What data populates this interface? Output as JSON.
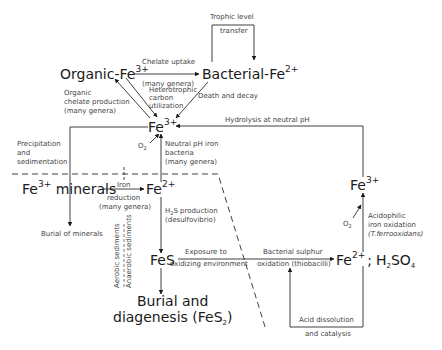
{
  "diagram": {
    "title": "",
    "nodes": {
      "organic_fe": {
        "base": "Organic-Fe",
        "sup": "3+"
      },
      "bacterial_fe": {
        "base": "Bacterial-Fe",
        "sup": "2+"
      },
      "fe3_center": {
        "base": "Fe",
        "sup": "3+"
      },
      "fe3_minerals": {
        "base": "Fe",
        "sup": "3+",
        "rest": " minerals"
      },
      "fe2_mid": {
        "base": "Fe",
        "sup": "2+"
      },
      "fes": {
        "base": "FeS"
      },
      "burial": {
        "line1": "Burial and",
        "line2_base": "diagenesis (FeS",
        "line2_sub": "2",
        "line2_end": ")"
      },
      "fe2_h2so4": {
        "base": "Fe",
        "sup": "2+",
        "sep": ";",
        "h": "H",
        "h_sub": "2",
        "so": "SO",
        "so_sub": "4"
      },
      "fe3_right": {
        "base": "Fe",
        "sup": "3+"
      }
    },
    "labels": {
      "trophic1": "Trophic level",
      "trophic2": "transfer",
      "chelate1": "Chelate uptake",
      "chelate2": "(many genera)",
      "organic1": "Organic",
      "organic2": "chelate production",
      "organic3": "(many genera)",
      "hetero1": "Heterotrophic",
      "hetero2": "carbon",
      "hetero3": "utilization",
      "death": "Death and decay",
      "hydrolysis": "Hydrolysis at neutral pH",
      "o2_center": "O",
      "o2_sub": "2",
      "neutral1": "Neutral pH iron",
      "neutral2": "bacteria",
      "neutral3": "(many genera)",
      "precip1": "Precipitation",
      "precip2": "and",
      "precip3": "sedimentation",
      "iron1": "Iron",
      "iron2": "reduction",
      "iron3": "(many genera)",
      "h2s1_a": "H",
      "h2s1_sub": "2",
      "h2s1_b": "S production",
      "h2s2": "(desulfovibrio)",
      "burial_minerals": "Burial of minerals",
      "aerobic": "Aerobic sediments",
      "anaerobic": "Anaerobic sediments",
      "exposure1": "Exposure to",
      "exposure2": "oxidizing environment",
      "bact_sulphur1": "Bacterial sulphur",
      "bact_sulphur2": "oxidation (thiobacilli)",
      "acid1": "Acid dissolution",
      "acid2": "and catalysis",
      "acido1": "Acidophilic",
      "acido2": "iron oxidation",
      "acido3": "(T.ferrooxidans)",
      "o2_right": "O",
      "o2_right_sub": "2"
    },
    "colors": {
      "line": "#2a2a2a",
      "text": "#1a1a1a",
      "label": "#444444"
    }
  }
}
